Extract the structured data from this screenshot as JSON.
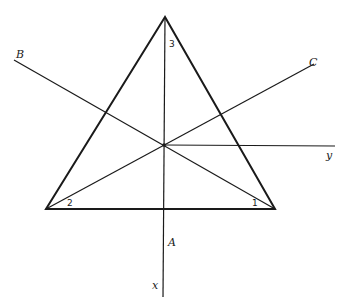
{
  "diagram": {
    "type": "geometry-figure",
    "colors": {
      "line": "#1a1a1a",
      "background": "#ffffff"
    },
    "vertices": {
      "apex": {
        "label": "3",
        "x": 165,
        "y": 17
      },
      "left": {
        "label": "2",
        "x": 46,
        "y": 209
      },
      "right": {
        "label": "1",
        "x": 275,
        "y": 209
      }
    },
    "center": {
      "x": 164,
      "y": 145
    },
    "lines": {
      "B": {
        "label": "B",
        "from": [
          14,
          60
        ],
        "to": [
          275,
          209
        ]
      },
      "C": {
        "label": "C",
        "from": [
          46,
          209
        ],
        "to": [
          314,
          64
        ]
      },
      "y": {
        "label": "y",
        "from": [
          164,
          145
        ],
        "to": [
          335,
          146
        ]
      },
      "x": {
        "label": "x",
        "from": [
          165,
          17
        ],
        "to": [
          163,
          297
        ]
      },
      "A": {
        "label": "A"
      }
    },
    "labels": {
      "B": "B",
      "C": "C",
      "y": "y",
      "A": "A",
      "x": "x",
      "angle1": "1",
      "angle2": "2",
      "angle3": "3"
    }
  }
}
